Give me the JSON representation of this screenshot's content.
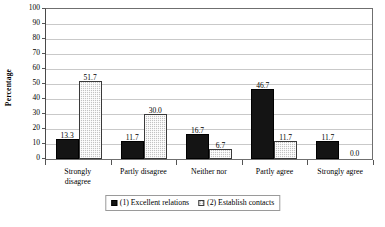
{
  "chart_data": {
    "type": "bar",
    "title": "",
    "xlabel": "",
    "ylabel": "Percentage",
    "ylim": [
      0,
      100
    ],
    "ytick_step": 10,
    "yticks": [
      0,
      10,
      20,
      30,
      40,
      50,
      60,
      70,
      80,
      90,
      100
    ],
    "grid": true,
    "legend_position": "bottom",
    "categories": [
      "Strongly disagree",
      "Partly disagree",
      "Neither nor",
      "Partly agree",
      "Strongly agree"
    ],
    "category_lines": [
      [
        "Strongly",
        "disagree"
      ],
      [
        "Partly disagree"
      ],
      [
        "Neither nor"
      ],
      [
        "Partly agree"
      ],
      [
        "Strongly agree"
      ]
    ],
    "series": [
      {
        "name": "(1) Excellent relations",
        "color": "#141414",
        "pattern": "solid",
        "values": [
          13.3,
          11.7,
          16.7,
          46.7,
          11.7
        ],
        "labels": [
          "13.3",
          "11.7",
          "16.7",
          "46.7",
          "11.7"
        ]
      },
      {
        "name": "(2) Establish contacts",
        "color": "#c2c2c2",
        "pattern": "stipple",
        "values": [
          51.7,
          30.0,
          6.7,
          11.7,
          0.0
        ],
        "labels": [
          "51.7",
          "30.0",
          "6.7",
          "11.7",
          "0.0"
        ]
      }
    ]
  },
  "legend": {
    "items": [
      {
        "label": "(1) Excellent relations"
      },
      {
        "label": "(2) Establish contacts"
      }
    ]
  }
}
